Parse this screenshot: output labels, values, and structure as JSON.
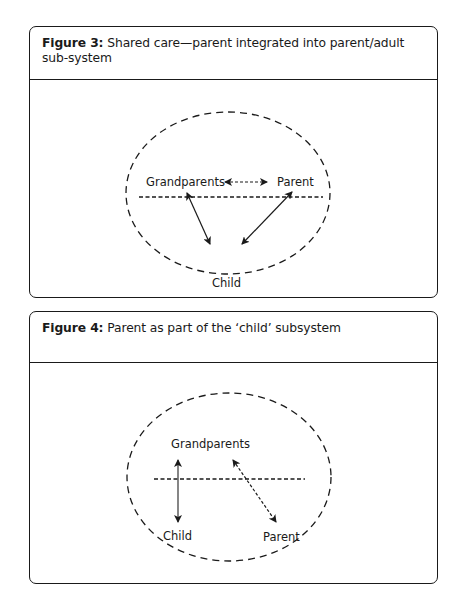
{
  "figures": [
    {
      "number_label": "Figure 3:",
      "caption": "Shared care—parent integrated into parent/adult sub-system",
      "nodes": {
        "grandparents": "Grandparents",
        "parent": "Parent",
        "child": "Child"
      },
      "edges": [
        {
          "from": "Grandparents",
          "to": "Parent",
          "style": "dashed",
          "direction": "both"
        },
        {
          "from": "Grandparents",
          "to": "Child",
          "style": "solid",
          "direction": "both"
        },
        {
          "from": "Parent",
          "to": "Child",
          "style": "solid",
          "direction": "both"
        }
      ],
      "boundary": "dashed horizontal line separating adult and child subsystems"
    },
    {
      "number_label": "Figure 4:",
      "caption": "Parent as part of the ‘child’ subsystem",
      "nodes": {
        "grandparents": "Grandparents",
        "child": "Child",
        "parent": "Parent"
      },
      "edges": [
        {
          "from": "Grandparents",
          "to": "Child",
          "style": "solid",
          "direction": "both"
        },
        {
          "from": "Grandparents",
          "to": "Parent",
          "style": "dashed",
          "direction": "both"
        }
      ],
      "boundary": "dashed horizontal line separating adult and child subsystems"
    }
  ]
}
